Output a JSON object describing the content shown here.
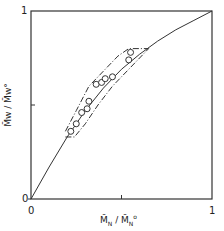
{
  "chart_data": {
    "type": "scatter",
    "title": "",
    "xlabel": "M̄N / M̄N°",
    "ylabel": "M̄w / M̄w°",
    "xlim": [
      0,
      1
    ],
    "ylim": [
      0,
      1
    ],
    "x_ticks": [
      "0",
      "1"
    ],
    "y_ticks": [
      "0",
      "1"
    ],
    "grid": false,
    "legend": null,
    "series": [
      {
        "name": "theoretical curve",
        "style": "solid line",
        "x": [
          0,
          0.1,
          0.2,
          0.3,
          0.4,
          0.5,
          0.6,
          0.7,
          0.8,
          0.9,
          1.0
        ],
        "y": [
          0,
          0.17,
          0.33,
          0.47,
          0.59,
          0.69,
          0.77,
          0.84,
          0.9,
          0.95,
          1.0
        ]
      },
      {
        "name": "experimental points",
        "style": "open circles",
        "x": [
          0.22,
          0.25,
          0.28,
          0.31,
          0.32,
          0.36,
          0.39,
          0.41,
          0.45,
          0.54,
          0.55
        ],
        "y": [
          0.36,
          0.4,
          0.46,
          0.48,
          0.52,
          0.61,
          0.62,
          0.64,
          0.65,
          0.74,
          0.78
        ]
      },
      {
        "name": "envelope upper",
        "style": "dash-dot line",
        "x": [
          0.19,
          0.25,
          0.32,
          0.4,
          0.48,
          0.54,
          0.65
        ],
        "y": [
          0.36,
          0.47,
          0.6,
          0.68,
          0.76,
          0.8,
          0.8
        ]
      },
      {
        "name": "envelope lower",
        "style": "dash-dot line",
        "x": [
          0.19,
          0.24,
          0.3,
          0.37,
          0.45,
          0.55,
          0.65
        ],
        "y": [
          0.33,
          0.33,
          0.4,
          0.5,
          0.6,
          0.7,
          0.8
        ]
      }
    ]
  },
  "axes": {
    "x_label_main": "M̄",
    "x_label_sub": "N",
    "x_label_sep": " / ",
    "x_label_main2": "M̄",
    "x_label_sub2": "N",
    "x_label_sup2": "o",
    "y_label": "M̄w / M̄w°",
    "x_tick_0": "0",
    "x_tick_1": "1",
    "y_tick_0": "0",
    "y_tick_1": "1"
  }
}
